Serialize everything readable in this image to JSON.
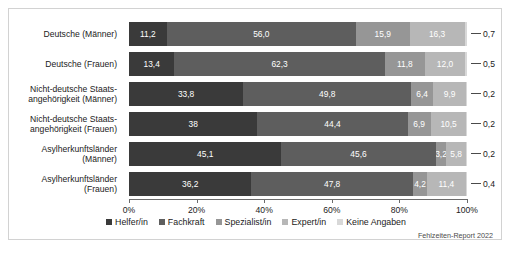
{
  "chart_data": {
    "type": "bar",
    "orientation": "horizontal",
    "stacked": true,
    "normalized_percent": true,
    "title": "",
    "xlabel": "",
    "ylabel": "",
    "xlim": [
      0,
      100
    ],
    "grid": false,
    "legend_position": "bottom",
    "categories": [
      "Deutsche (Männer)",
      "Deutsche (Frauen)",
      "Nicht-deutsche Staatsangehörigkeit (Männer)",
      "Nicht-deutsche Staatsangehörigkeit (Frauen)",
      "Asylherkunftsländer (Männer)",
      "Asylherkunftsländer (Frauen)"
    ],
    "series": [
      {
        "name": "Helfer/in",
        "color": "#3a3a3a",
        "values": [
          11.2,
          13.4,
          33.8,
          38.0,
          45.1,
          36.2
        ]
      },
      {
        "name": "Fachkraft",
        "color": "#5e5e5e",
        "values": [
          56.0,
          62.3,
          49.8,
          44.4,
          45.6,
          47.8
        ]
      },
      {
        "name": "Spezialist/in",
        "color": "#969696",
        "values": [
          15.9,
          11.8,
          6.4,
          6.9,
          3.2,
          4.2
        ]
      },
      {
        "name": "Expert/in",
        "color": "#b7b7b7",
        "values": [
          16.3,
          12.0,
          9.9,
          10.5,
          5.8,
          11.4
        ]
      },
      {
        "name": "Keine Angaben",
        "color": "#d8d8d8",
        "values": [
          0.7,
          0.5,
          0.2,
          0.2,
          0.2,
          0.4
        ]
      }
    ],
    "xticks": [
      0,
      20,
      40,
      60,
      80,
      100
    ],
    "xtick_labels": [
      "0%",
      "20%",
      "40%",
      "60%",
      "80%",
      "100%"
    ]
  },
  "rows": [
    {
      "label_lines": [
        "Deutsche (Männer)"
      ],
      "segments": [
        {
          "label": "11,2",
          "value": 11.2,
          "style": "s0",
          "show": true
        },
        {
          "label": "56,0",
          "value": 56.0,
          "style": "s1",
          "show": true
        },
        {
          "label": "15,9",
          "value": 15.9,
          "style": "s2",
          "show": true
        },
        {
          "label": "16,3",
          "value": 16.3,
          "style": "s3",
          "show": true
        },
        {
          "label": "",
          "value": 0.7,
          "style": "s4",
          "show": false
        }
      ],
      "tail_value": "0,7"
    },
    {
      "label_lines": [
        "Deutsche (Frauen)"
      ],
      "segments": [
        {
          "label": "13,4",
          "value": 13.4,
          "style": "s0",
          "show": true
        },
        {
          "label": "62,3",
          "value": 62.3,
          "style": "s1",
          "show": true
        },
        {
          "label": "11,8",
          "value": 11.8,
          "style": "s2",
          "show": true
        },
        {
          "label": "12,0",
          "value": 12.0,
          "style": "s3",
          "show": true
        },
        {
          "label": "",
          "value": 0.5,
          "style": "s4",
          "show": false
        }
      ],
      "tail_value": "0,5"
    },
    {
      "label_lines": [
        "Nicht-deutsche Staats-",
        "angehörigkeit (Männer)"
      ],
      "segments": [
        {
          "label": "33,8",
          "value": 33.8,
          "style": "s0",
          "show": true
        },
        {
          "label": "49,8",
          "value": 49.8,
          "style": "s1",
          "show": true
        },
        {
          "label": "6,4",
          "value": 6.4,
          "style": "s2",
          "show": true
        },
        {
          "label": "9,9",
          "value": 9.9,
          "style": "s3",
          "show": true
        },
        {
          "label": "",
          "value": 0.2,
          "style": "s4",
          "show": false
        }
      ],
      "tail_value": "0,2"
    },
    {
      "label_lines": [
        "Nicht-deutsche Staats-",
        "angehörigkeit (Frauen)"
      ],
      "segments": [
        {
          "label": "38",
          "value": 38.0,
          "style": "s0",
          "show": true
        },
        {
          "label": "44,4",
          "value": 44.4,
          "style": "s1",
          "show": true
        },
        {
          "label": "6,9",
          "value": 6.9,
          "style": "s2",
          "show": true
        },
        {
          "label": "10,5",
          "value": 10.5,
          "style": "s3",
          "show": true
        },
        {
          "label": "",
          "value": 0.2,
          "style": "s4",
          "show": false
        }
      ],
      "tail_value": "0,2"
    },
    {
      "label_lines": [
        "Asylherkunftsländer",
        "(Männer)"
      ],
      "segments": [
        {
          "label": "45,1",
          "value": 45.1,
          "style": "s0",
          "show": true
        },
        {
          "label": "45,6",
          "value": 45.6,
          "style": "s1",
          "show": true
        },
        {
          "label": "3,2",
          "value": 3.2,
          "style": "s2",
          "show": true
        },
        {
          "label": "5,8",
          "value": 5.8,
          "style": "s3",
          "show": true
        },
        {
          "label": "",
          "value": 0.2,
          "style": "s4",
          "show": false
        }
      ],
      "tail_value": "0,2"
    },
    {
      "label_lines": [
        "Asylherkunftsländer",
        "(Frauen)"
      ],
      "segments": [
        {
          "label": "36,2",
          "value": 36.2,
          "style": "s0",
          "show": true
        },
        {
          "label": "47,8",
          "value": 47.8,
          "style": "s1",
          "show": true
        },
        {
          "label": "4,2",
          "value": 4.2,
          "style": "s2",
          "show": true
        },
        {
          "label": "11,4",
          "value": 11.4,
          "style": "s3",
          "show": true
        },
        {
          "label": "",
          "value": 0.4,
          "style": "s4",
          "show": false
        }
      ],
      "tail_value": "0,4"
    }
  ],
  "axis": {
    "ticks": [
      {
        "label": "0%",
        "value": 0
      },
      {
        "label": "20%",
        "value": 20
      },
      {
        "label": "40%",
        "value": 40
      },
      {
        "label": "60%",
        "value": 60
      },
      {
        "label": "80%",
        "value": 80
      },
      {
        "label": "100%",
        "value": 100
      }
    ]
  },
  "legend": {
    "items": [
      {
        "label": "Helfer/in",
        "swatch": "sw0"
      },
      {
        "label": "Fachkraft",
        "swatch": "sw1"
      },
      {
        "label": "Spezialist/in",
        "swatch": "sw2"
      },
      {
        "label": "Expert/in",
        "swatch": "sw3"
      },
      {
        "label": "Keine Angaben",
        "swatch": "sw4"
      }
    ]
  },
  "source": {
    "text": "Fehlzeiten-Report 2022"
  }
}
